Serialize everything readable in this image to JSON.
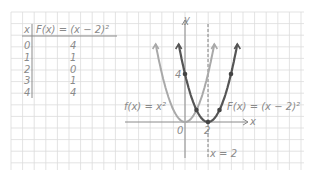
{
  "table": {
    "header_x": "x",
    "header_f": "F(x) = (x − 2)²",
    "rows": [
      {
        "x": "0",
        "f": "4"
      },
      {
        "x": "1",
        "f": "1"
      },
      {
        "x": "2",
        "f": "0"
      },
      {
        "x": "3",
        "f": "1"
      },
      {
        "x": "4",
        "f": "4"
      }
    ]
  },
  "graph": {
    "y_axis_label": "y",
    "x_axis_label": "x",
    "tick_4": "4",
    "tick_0": "0",
    "tick_2": "2",
    "label_f": "f(x) = x²",
    "label_F": "F(x) = (x − 2)²",
    "label_asymptote": "x = 2"
  },
  "colors": {
    "grid": "#d9d9d9",
    "f_curve": "#a9a9a9",
    "F_curve": "#555555",
    "text": "#8a8a8a"
  },
  "chart_data": {
    "type": "line",
    "title": "",
    "xlabel": "x",
    "ylabel": "y",
    "series": [
      {
        "name": "f(x) = x²",
        "x": [
          -2,
          -1,
          0,
          1,
          2
        ],
        "values": [
          4,
          1,
          0,
          1,
          4
        ]
      },
      {
        "name": "F(x) = (x − 2)²",
        "x": [
          0,
          1,
          2,
          3,
          4
        ],
        "values": [
          4,
          1,
          0,
          1,
          4
        ]
      }
    ],
    "annotations": [
      "x = 2 (axis of symmetry, dashed)",
      "y = 4 tick",
      "0",
      "2"
    ],
    "table": {
      "columns": [
        "x",
        "F(x) = (x − 2)²"
      ],
      "rows": [
        [
          0,
          4
        ],
        [
          1,
          1
        ],
        [
          2,
          0
        ],
        [
          3,
          1
        ],
        [
          4,
          4
        ]
      ]
    },
    "grid": true
  }
}
